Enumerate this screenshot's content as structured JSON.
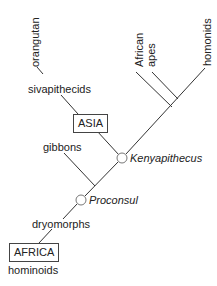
{
  "diagram": {
    "title": "",
    "type": "phylogenetic-tree",
    "line_color": "#333333",
    "node_fill": "#ffffff",
    "node_stroke": "#777777",
    "labels": {
      "orangutan": "orangutan",
      "sivapithecids": "sivapithecids",
      "asia": "ASIA",
      "african": "African",
      "apes": "apes",
      "homonids": "homonids",
      "gibbons": "gibbons",
      "kenyapithecus": "Kenyapithecus",
      "proconsul": "Proconsul",
      "dryomorphs": "dryomorphs",
      "africa": "AFRICA",
      "hominoids": "hominoids"
    },
    "nodes": [
      {
        "name": "Kenyapithecus",
        "style": "open-circle"
      },
      {
        "name": "Proconsul",
        "style": "open-circle"
      }
    ],
    "regions": [
      "ASIA",
      "AFRICA"
    ]
  }
}
